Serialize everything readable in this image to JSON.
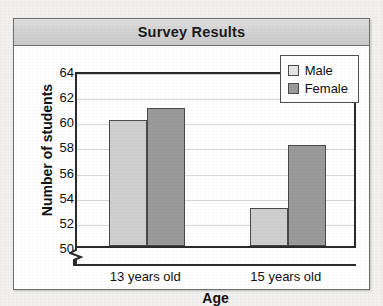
{
  "card": {
    "title": "Survey Results"
  },
  "chart_data": {
    "type": "bar",
    "title": "Survey Results",
    "xlabel": "Age",
    "ylabel": "Number of students",
    "categories": [
      "13 years old",
      "15 years old"
    ],
    "series": [
      {
        "name": "Male",
        "values": [
          60,
          53
        ],
        "color": "#cfcfcf"
      },
      {
        "name": "Female",
        "values": [
          61,
          58
        ],
        "color": "#9a9a9a"
      }
    ],
    "yticks": [
      50,
      52,
      54,
      56,
      58,
      60,
      62,
      64
    ],
    "ylim": [
      50,
      64
    ],
    "y_axis_break": true,
    "grid": true,
    "legend_position": "top-right"
  },
  "legend": {
    "items": [
      {
        "label": "Male",
        "swatch": "male-swatch"
      },
      {
        "label": "Female",
        "swatch": "female-swatch"
      }
    ]
  },
  "icons": {
    "axis_break": "axis-break-zigzag"
  }
}
